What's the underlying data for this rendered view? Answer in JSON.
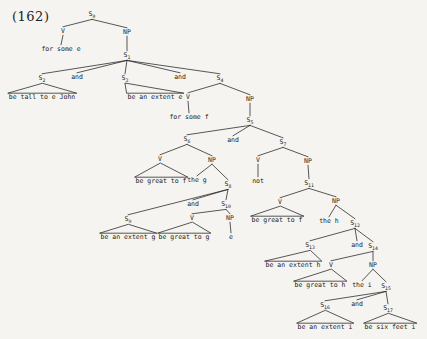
{
  "figure_label": "(162)",
  "colors": {
    "paper": "#f5f4f0",
    "ink": "#222222"
  },
  "tree": {
    "nodes": [
      {
        "id": "S0",
        "label": "S",
        "sub": "0",
        "x": 92,
        "y": 16
      },
      {
        "id": "V_a",
        "label": "V",
        "x": 63,
        "y": 33
      },
      {
        "id": "NP_a",
        "label": "NP",
        "x": 127,
        "y": 34
      },
      {
        "id": "w_forsome_e",
        "label": "for some e",
        "x": 61,
        "y": 51,
        "terminal": true
      },
      {
        "id": "S1",
        "label": "S",
        "sub": "1",
        "x": 127,
        "y": 57
      },
      {
        "id": "S2",
        "label": "S",
        "sub": "2",
        "x": 42,
        "y": 80
      },
      {
        "id": "and1",
        "label": "and",
        "x": 77,
        "y": 79,
        "terminal": true
      },
      {
        "id": "S3",
        "label": "S",
        "sub": "3",
        "x": 125,
        "y": 80
      },
      {
        "id": "and2",
        "label": "and",
        "x": 180,
        "y": 79,
        "terminal": true
      },
      {
        "id": "S4",
        "label": "S",
        "sub": "4",
        "x": 220,
        "y": 80
      },
      {
        "id": "w_betalltoejohn",
        "label": "be tall to e John",
        "x": 42,
        "y": 99,
        "terminal": true
      },
      {
        "id": "w_beanextente",
        "label": "be an extent e",
        "x": 155,
        "y": 99,
        "terminal": true
      },
      {
        "id": "V_b",
        "label": "V",
        "x": 188,
        "y": 99
      },
      {
        "id": "NP_b",
        "label": "NP",
        "x": 250,
        "y": 101
      },
      {
        "id": "w_forsomef",
        "label": "for some f",
        "x": 189,
        "y": 119,
        "terminal": true
      },
      {
        "id": "S5",
        "label": "S",
        "sub": "5",
        "x": 250,
        "y": 122
      },
      {
        "id": "S6",
        "label": "S",
        "sub": "6",
        "x": 187,
        "y": 141
      },
      {
        "id": "and3",
        "label": "and",
        "x": 233,
        "y": 142,
        "terminal": true
      },
      {
        "id": "S7",
        "label": "S",
        "sub": "7",
        "x": 283,
        "y": 144
      },
      {
        "id": "V_c",
        "label": "V",
        "x": 160,
        "y": 161
      },
      {
        "id": "NP_c",
        "label": "NP",
        "x": 212,
        "y": 162
      },
      {
        "id": "V_e",
        "label": "V",
        "x": 258,
        "y": 162
      },
      {
        "id": "NP_e",
        "label": "NP",
        "x": 308,
        "y": 163
      },
      {
        "id": "w_begreattof1",
        "label": "be great to f",
        "x": 161,
        "y": 183,
        "terminal": true
      },
      {
        "id": "w_theg",
        "label": "the g",
        "x": 197,
        "y": 182,
        "terminal": true
      },
      {
        "id": "S8",
        "label": "S",
        "sub": "8",
        "x": 228,
        "y": 186
      },
      {
        "id": "w_not",
        "label": "not",
        "x": 258,
        "y": 183,
        "terminal": true
      },
      {
        "id": "S11",
        "label": "S",
        "sub": "11",
        "x": 309,
        "y": 185
      },
      {
        "id": "and4",
        "label": "and",
        "x": 193,
        "y": 206,
        "terminal": true
      },
      {
        "id": "S10",
        "label": "S",
        "sub": "10",
        "x": 226,
        "y": 206
      },
      {
        "id": "V_f",
        "label": "V",
        "x": 280,
        "y": 204
      },
      {
        "id": "NP_f",
        "label": "NP",
        "x": 336,
        "y": 203
      },
      {
        "id": "S9",
        "label": "S",
        "sub": "9",
        "x": 128,
        "y": 221
      },
      {
        "id": "V_d",
        "label": "V",
        "x": 192,
        "y": 220
      },
      {
        "id": "NP_d",
        "label": "NP",
        "x": 230,
        "y": 220
      },
      {
        "id": "w_begreattof2",
        "label": "be great to f",
        "x": 277,
        "y": 222,
        "terminal": true
      },
      {
        "id": "w_theh",
        "label": "the h",
        "x": 329,
        "y": 223,
        "terminal": true
      },
      {
        "id": "S12",
        "label": "S",
        "sub": "12",
        "x": 355,
        "y": 225
      },
      {
        "id": "w_beanextentg",
        "label": "be an extent g",
        "x": 128,
        "y": 239,
        "terminal": true
      },
      {
        "id": "w_begreattog",
        "label": "be great to g",
        "x": 184,
        "y": 239,
        "terminal": true
      },
      {
        "id": "w_e",
        "label": "e",
        "x": 231,
        "y": 239,
        "terminal": true
      },
      {
        "id": "S13",
        "label": "S",
        "sub": "13",
        "x": 310,
        "y": 247
      },
      {
        "id": "and5",
        "label": "and",
        "x": 357,
        "y": 247,
        "terminal": true
      },
      {
        "id": "S14",
        "label": "S",
        "sub": "14",
        "x": 373,
        "y": 248
      },
      {
        "id": "w_beanextenth",
        "label": "be an extent h",
        "x": 293,
        "y": 267,
        "terminal": true
      },
      {
        "id": "V_g",
        "label": "V",
        "x": 331,
        "y": 267
      },
      {
        "id": "NP_g",
        "label": "NP",
        "x": 373,
        "y": 267
      },
      {
        "id": "w_begreattoh",
        "label": "be great to h",
        "x": 320,
        "y": 287,
        "terminal": true
      },
      {
        "id": "w_thei",
        "label": "the i",
        "x": 362,
        "y": 287,
        "terminal": true
      },
      {
        "id": "S15",
        "label": "S",
        "sub": "15",
        "x": 386,
        "y": 288
      },
      {
        "id": "S16",
        "label": "S",
        "sub": "16",
        "x": 325,
        "y": 307
      },
      {
        "id": "and6",
        "label": "and",
        "x": 357,
        "y": 306,
        "terminal": true
      },
      {
        "id": "S17",
        "label": "S",
        "sub": "17",
        "x": 388,
        "y": 310
      },
      {
        "id": "w_beanextenti",
        "label": "be an extent i",
        "x": 325,
        "y": 329,
        "terminal": true
      },
      {
        "id": "w_besixfeeti",
        "label": "be six feet i",
        "x": 390,
        "y": 329,
        "terminal": true
      }
    ],
    "edges": [
      [
        "S0",
        "V_a"
      ],
      [
        "S0",
        "NP_a"
      ],
      [
        "V_a",
        "w_forsome_e"
      ],
      [
        "NP_a",
        "S1"
      ],
      [
        "S1",
        "S2"
      ],
      [
        "S1",
        "and1"
      ],
      [
        "S1",
        "S3"
      ],
      [
        "S1",
        "and2"
      ],
      [
        "S1",
        "S4"
      ],
      [
        "S4",
        "V_b"
      ],
      [
        "S4",
        "NP_b"
      ],
      [
        "V_b",
        "w_forsomef"
      ],
      [
        "NP_b",
        "S5"
      ],
      [
        "S5",
        "S6"
      ],
      [
        "S5",
        "and3"
      ],
      [
        "S5",
        "S7"
      ],
      [
        "S6",
        "V_c"
      ],
      [
        "S6",
        "NP_c"
      ],
      [
        "NP_c",
        "w_theg"
      ],
      [
        "NP_c",
        "S8"
      ],
      [
        "S8",
        "S9"
      ],
      [
        "S8",
        "and4"
      ],
      [
        "S8",
        "S10"
      ],
      [
        "S10",
        "V_d"
      ],
      [
        "S10",
        "NP_d"
      ],
      [
        "NP_d",
        "w_e"
      ],
      [
        "S7",
        "V_e"
      ],
      [
        "S7",
        "NP_e"
      ],
      [
        "V_e",
        "w_not"
      ],
      [
        "NP_e",
        "S11"
      ],
      [
        "S11",
        "V_f"
      ],
      [
        "S11",
        "NP_f"
      ],
      [
        "NP_f",
        "w_theh"
      ],
      [
        "NP_f",
        "S12"
      ],
      [
        "S12",
        "S13"
      ],
      [
        "S12",
        "and5"
      ],
      [
        "S12",
        "S14"
      ],
      [
        "S14",
        "V_g"
      ],
      [
        "S14",
        "NP_g"
      ],
      [
        "NP_g",
        "w_thei"
      ],
      [
        "NP_g",
        "S15"
      ],
      [
        "S15",
        "S16"
      ],
      [
        "S15",
        "and6"
      ],
      [
        "S15",
        "S17"
      ]
    ],
    "triangles": [
      [
        "S2",
        "w_betalltoejohn"
      ],
      [
        "S3",
        "w_beanextente"
      ],
      [
        "V_c",
        "w_begreattof1"
      ],
      [
        "S9",
        "w_beanextentg"
      ],
      [
        "V_d",
        "w_begreattog"
      ],
      [
        "V_f",
        "w_begreattof2"
      ],
      [
        "S13",
        "w_beanextenth"
      ],
      [
        "V_g",
        "w_begreattoh"
      ],
      [
        "S16",
        "w_beanextenti"
      ],
      [
        "S17",
        "w_besixfeeti"
      ]
    ]
  }
}
